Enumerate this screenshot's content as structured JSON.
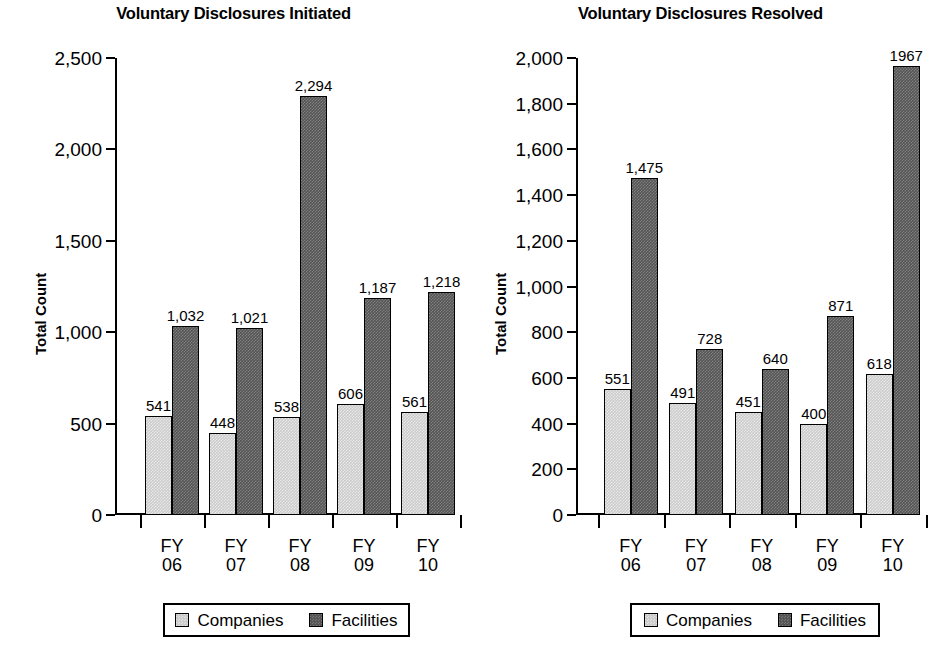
{
  "charts": [
    {
      "title": "Voluntary Disclosures Initiated",
      "ylabel": "Total Count",
      "legend": {
        "companies": "Companies",
        "facilities": "Facilities"
      }
    },
    {
      "title": "Voluntary Disclosures Resolved",
      "ylabel": "Total Count",
      "legend": {
        "companies": "Companies",
        "facilities": "Facilities"
      }
    }
  ],
  "chart_data": [
    {
      "type": "bar",
      "title": "Voluntary Disclosures Initiated",
      "xlabel": "",
      "ylabel": "Total Count",
      "categories": [
        "FY 06",
        "FY 07",
        "FY 08",
        "FY 09",
        "FY 10"
      ],
      "category_lines": [
        [
          "FY",
          "06"
        ],
        [
          "FY",
          "07"
        ],
        [
          "FY",
          "08"
        ],
        [
          "FY",
          "09"
        ],
        [
          "FY",
          "10"
        ]
      ],
      "series": [
        {
          "name": "Companies",
          "values": [
            541,
            448,
            538,
            606,
            561
          ],
          "labels": [
            "541",
            "448",
            "538",
            "606",
            "561"
          ],
          "color": "#cbcbcb"
        },
        {
          "name": "Facilities",
          "values": [
            1032,
            1021,
            2294,
            1187,
            1218
          ],
          "labels": [
            "1,032",
            "1,021",
            "2,294",
            "1,187",
            "1,218"
          ],
          "color": "#555555"
        }
      ],
      "ylim": [
        0,
        2500
      ],
      "yticks": [
        0,
        500,
        1000,
        1500,
        2000,
        2500
      ],
      "ytick_labels": [
        "0",
        "500",
        "1,000",
        "1,500",
        "2,000",
        "2,500"
      ],
      "grid": false,
      "legend_position": "bottom"
    },
    {
      "type": "bar",
      "title": "Voluntary Disclosures Resolved",
      "xlabel": "",
      "ylabel": "Total Count",
      "categories": [
        "FY 06",
        "FY 07",
        "FY 08",
        "FY 09",
        "FY 10"
      ],
      "category_lines": [
        [
          "FY",
          "06"
        ],
        [
          "FY",
          "07"
        ],
        [
          "FY",
          "08"
        ],
        [
          "FY",
          "09"
        ],
        [
          "FY",
          "10"
        ]
      ],
      "series": [
        {
          "name": "Companies",
          "values": [
            551,
            491,
            451,
            400,
            618
          ],
          "labels": [
            "551",
            "491",
            "451",
            "400",
            "618"
          ],
          "color": "#cbcbcb"
        },
        {
          "name": "Facilities",
          "values": [
            1475,
            728,
            640,
            871,
            1967
          ],
          "labels": [
            "1,475",
            "728",
            "640",
            "871",
            "1967"
          ],
          "color": "#555555"
        }
      ],
      "ylim": [
        0,
        2000
      ],
      "yticks": [
        0,
        200,
        400,
        600,
        800,
        1000,
        1200,
        1400,
        1600,
        1800,
        2000
      ],
      "ytick_labels": [
        "0",
        "200",
        "400",
        "600",
        "800",
        "1,000",
        "1,200",
        "1,400",
        "1,600",
        "1,800",
        "2,000"
      ],
      "grid": false,
      "legend_position": "bottom"
    }
  ]
}
